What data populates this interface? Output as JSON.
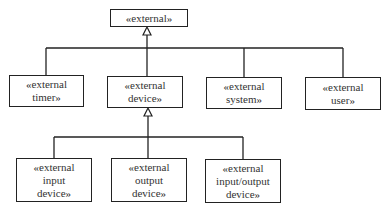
{
  "diagram": {
    "type": "UML generalization hierarchy",
    "root": {
      "label": "«external»"
    },
    "level1": [
      {
        "label": "«external\ntimer»"
      },
      {
        "label": "«external\ndevice»"
      },
      {
        "label": "«external\nsystem»"
      },
      {
        "label": "«external\nuser»"
      }
    ],
    "level2": [
      {
        "label": "«external\ninput\ndevice»"
      },
      {
        "label": "«external\noutput\ndevice»"
      },
      {
        "label": "«external\ninput/output\ndevice»"
      }
    ],
    "relations": [
      {
        "from": "«external timer»",
        "to": "«external»",
        "kind": "generalization"
      },
      {
        "from": "«external device»",
        "to": "«external»",
        "kind": "generalization"
      },
      {
        "from": "«external system»",
        "to": "«external»",
        "kind": "generalization"
      },
      {
        "from": "«external user»",
        "to": "«external»",
        "kind": "generalization"
      },
      {
        "from": "«external input device»",
        "to": "«external device»",
        "kind": "generalization"
      },
      {
        "from": "«external output device»",
        "to": "«external device»",
        "kind": "generalization"
      },
      {
        "from": "«external input/output device»",
        "to": "«external device»",
        "kind": "generalization"
      }
    ]
  }
}
